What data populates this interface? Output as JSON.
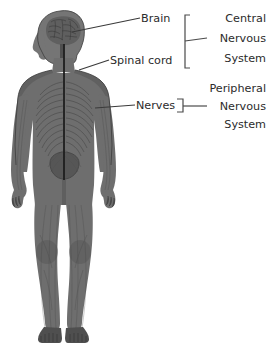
{
  "diagram": {
    "figure": {
      "name": "human-body-nervous-system",
      "description": "Front-facing human body silhouette showing brain, spinal cord and peripheral nerves"
    },
    "labels": [
      {
        "id": "brain",
        "text": "Brain"
      },
      {
        "id": "spinal-cord",
        "text": "Spinal cord"
      },
      {
        "id": "nerves",
        "text": "Nerves"
      }
    ],
    "groups": [
      {
        "id": "central-nervous-system",
        "lines": [
          "Central",
          "Nervous",
          "System"
        ]
      },
      {
        "id": "peripheral-nervous-system",
        "lines": [
          "Peripheral",
          "Nervous",
          "System"
        ]
      }
    ],
    "colors": {
      "background": "#ffffff",
      "text": "#2b2b2b",
      "leader_line": "#3a3a3a",
      "bracket": "#4a4a4a",
      "body": "#6e6e6e",
      "body_shadow": "#4f4f4f",
      "spinal_cord": "#1e1e1e",
      "brain": "#5f5f5f"
    }
  }
}
